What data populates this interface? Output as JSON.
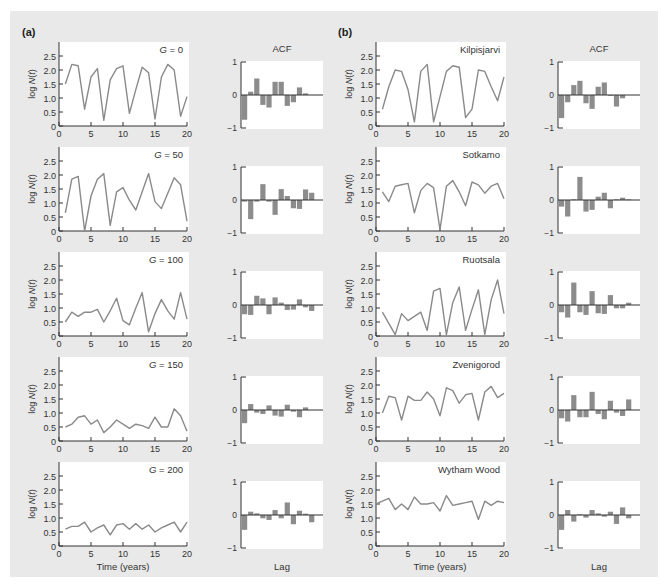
{
  "panels": [
    {
      "label": "(a)",
      "acf_title": "ACF",
      "xlabel": "Time (years)",
      "acf_xlabel": "Lag"
    },
    {
      "label": "(b)",
      "acf_title": "ACF",
      "xlabel": "Time (years)",
      "acf_xlabel": "Lag"
    }
  ],
  "axes": {
    "ylabel": "log N(t)",
    "yticks": [
      "0",
      "0.5",
      "1.0",
      "1.5",
      "2.0",
      "2.5"
    ],
    "xticks": [
      "0",
      "5",
      "10",
      "15",
      "20"
    ],
    "acf_yticks": [
      "1",
      "0",
      "−1"
    ]
  },
  "colors": {
    "background": "#e9e9e9",
    "plot_bg": "#ffffff",
    "line": "#8a8a8a",
    "bar": "#8c8c8c",
    "axis": "#333333"
  },
  "chart_data": [
    {
      "type": "line",
      "panel": "a",
      "title": "G = 0",
      "xlabel": "Time (years)",
      "ylabel": "log N(t)",
      "xlim": [
        0,
        20
      ],
      "ylim": [
        0,
        3
      ],
      "x": [
        1,
        2,
        3,
        4,
        5,
        6,
        7,
        8,
        9,
        10,
        11,
        12,
        13,
        14,
        15,
        16,
        17,
        18,
        19,
        20
      ],
      "values": [
        1.5,
        2.2,
        2.15,
        0.6,
        1.75,
        2.05,
        0.2,
        1.65,
        2.05,
        2.15,
        0.45,
        1.3,
        2.1,
        1.9,
        0.25,
        1.75,
        2.2,
        2.0,
        0.35,
        1.05
      ]
    },
    {
      "type": "bar",
      "panel": "a",
      "title": "ACF",
      "series_of": "G = 0",
      "ylim": [
        -1,
        1
      ],
      "values": [
        -0.75,
        0.1,
        0.5,
        -0.3,
        -0.38,
        0.4,
        0.4,
        -0.33,
        -0.22,
        0.23,
        0.05
      ]
    },
    {
      "type": "line",
      "panel": "a",
      "title": "G = 50",
      "xlim": [
        0,
        20
      ],
      "ylim": [
        0,
        3
      ],
      "x": [
        1,
        2,
        3,
        4,
        5,
        6,
        7,
        8,
        9,
        10,
        11,
        12,
        13,
        14,
        15,
        16,
        17,
        18,
        19,
        20
      ],
      "values": [
        0.65,
        1.85,
        1.95,
        0.0,
        1.25,
        1.85,
        2.05,
        0.2,
        1.4,
        1.55,
        1.1,
        0.75,
        1.4,
        2.05,
        1.05,
        0.8,
        1.35,
        1.9,
        1.65,
        0.35
      ]
    },
    {
      "type": "bar",
      "panel": "a",
      "title": "ACF",
      "series_of": "G = 50",
      "ylim": [
        -1,
        1
      ],
      "values": [
        -0.05,
        -0.58,
        -0.05,
        0.48,
        -0.05,
        -0.45,
        0.33,
        0.12,
        -0.25,
        -0.27,
        0.32,
        0.22
      ]
    },
    {
      "type": "line",
      "panel": "a",
      "title": "G = 100",
      "xlim": [
        0,
        20
      ],
      "ylim": [
        0,
        3
      ],
      "x": [
        1,
        2,
        3,
        4,
        5,
        6,
        7,
        8,
        9,
        10,
        11,
        12,
        13,
        14,
        15,
        16,
        17,
        18,
        19,
        20
      ],
      "values": [
        0.5,
        0.85,
        0.7,
        0.85,
        0.85,
        0.95,
        0.5,
        0.9,
        1.35,
        0.55,
        0.4,
        1.0,
        1.55,
        0.15,
        0.8,
        1.3,
        0.9,
        0.6,
        1.55,
        0.6
      ]
    },
    {
      "type": "bar",
      "panel": "a",
      "title": "ACF",
      "series_of": "G = 100",
      "ylim": [
        -1,
        1
      ],
      "values": [
        -0.28,
        -0.3,
        0.28,
        0.2,
        -0.28,
        0.23,
        0.07,
        -0.15,
        -0.14,
        0.17,
        -0.07,
        -0.18
      ]
    },
    {
      "type": "line",
      "panel": "a",
      "title": "G = 150",
      "xlim": [
        0,
        20
      ],
      "ylim": [
        0,
        3
      ],
      "x": [
        1,
        2,
        3,
        4,
        5,
        6,
        7,
        8,
        9,
        10,
        11,
        12,
        13,
        14,
        15,
        16,
        17,
        18,
        19,
        20
      ],
      "values": [
        0.5,
        0.6,
        0.85,
        0.9,
        0.6,
        0.75,
        0.3,
        0.5,
        0.75,
        0.6,
        0.45,
        0.6,
        0.55,
        0.45,
        0.85,
        0.5,
        0.5,
        1.15,
        0.9,
        0.35
      ]
    },
    {
      "type": "bar",
      "panel": "a",
      "title": "ACF",
      "series_of": "G = 150",
      "ylim": [
        -1,
        1
      ],
      "values": [
        -0.4,
        0.18,
        -0.08,
        -0.12,
        0.14,
        -0.17,
        -0.2,
        0.16,
        -0.05,
        -0.22,
        0.08
      ]
    },
    {
      "type": "line",
      "panel": "a",
      "title": "G = 200",
      "xlim": [
        0,
        20
      ],
      "ylim": [
        0,
        3
      ],
      "x": [
        1,
        2,
        3,
        4,
        5,
        6,
        7,
        8,
        9,
        10,
        11,
        12,
        13,
        14,
        15,
        16,
        17,
        18,
        19,
        20
      ],
      "values": [
        0.6,
        0.7,
        0.7,
        0.85,
        0.5,
        0.65,
        0.75,
        0.4,
        0.75,
        0.8,
        0.6,
        0.8,
        0.6,
        0.75,
        0.5,
        0.65,
        0.75,
        0.85,
        0.5,
        0.85
      ]
    },
    {
      "type": "bar",
      "panel": "a",
      "title": "ACF",
      "series_of": "G = 200",
      "ylim": [
        -1,
        1
      ],
      "values": [
        -0.45,
        0.1,
        0.05,
        -0.1,
        -0.15,
        0.15,
        -0.1,
        0.38,
        -0.28,
        0.13,
        0.04,
        -0.22
      ]
    },
    {
      "type": "line",
      "panel": "b",
      "title": "Kilpisjarvi",
      "xlim": [
        0,
        20
      ],
      "ylim": [
        0,
        3
      ],
      "x": [
        1,
        2,
        3,
        4,
        5,
        6,
        7,
        8,
        9,
        10,
        11,
        12,
        13,
        14,
        15,
        16,
        17,
        18,
        19,
        20
      ],
      "values": [
        0.6,
        1.4,
        2.0,
        1.95,
        1.3,
        0.15,
        1.95,
        2.2,
        0.15,
        1.05,
        1.95,
        2.15,
        2.1,
        0.3,
        0.6,
        2.0,
        1.95,
        1.4,
        0.9,
        1.75
      ]
    },
    {
      "type": "bar",
      "panel": "b",
      "title": "ACF",
      "series_of": "Kilpisjarvi",
      "ylim": [
        -1,
        1
      ],
      "values": [
        -0.7,
        -0.22,
        0.3,
        0.43,
        -0.25,
        -0.42,
        0.25,
        0.38,
        -0.02,
        -0.35,
        -0.1
      ]
    },
    {
      "type": "line",
      "panel": "b",
      "title": "Sotkamo",
      "xlim": [
        0,
        20
      ],
      "ylim": [
        0,
        3
      ],
      "x": [
        1,
        2,
        3,
        4,
        5,
        6,
        7,
        8,
        9,
        10,
        11,
        12,
        13,
        14,
        15,
        16,
        17,
        18,
        19,
        20
      ],
      "values": [
        1.4,
        1.05,
        1.6,
        1.65,
        1.7,
        0.65,
        1.45,
        1.7,
        1.55,
        0.05,
        1.6,
        1.8,
        1.4,
        0.9,
        1.75,
        1.65,
        1.35,
        1.6,
        1.7,
        1.15
      ]
    },
    {
      "type": "bar",
      "panel": "b",
      "title": "ACF",
      "series_of": "Sotkamo",
      "ylim": [
        -1,
        1
      ],
      "values": [
        -0.2,
        -0.5,
        0.02,
        0.7,
        -0.35,
        -0.3,
        0.1,
        0.22,
        -0.25,
        0.02,
        0.07,
        0.02
      ]
    },
    {
      "type": "line",
      "panel": "b",
      "title": "Ruotsala",
      "xlim": [
        0,
        20
      ],
      "ylim": [
        0,
        3
      ],
      "x": [
        1,
        2,
        3,
        4,
        5,
        6,
        7,
        8,
        9,
        10,
        11,
        12,
        13,
        14,
        15,
        16,
        17,
        18,
        19,
        20
      ],
      "values": [
        0.85,
        0.45,
        0.05,
        0.8,
        0.55,
        0.7,
        0.85,
        0.2,
        1.6,
        1.7,
        0.05,
        1.2,
        1.75,
        0.2,
        0.95,
        1.65,
        0.05,
        1.3,
        2.0,
        0.8
      ]
    },
    {
      "type": "bar",
      "panel": "b",
      "title": "ACF",
      "series_of": "Ruotsala",
      "ylim": [
        -1,
        1
      ],
      "values": [
        -0.22,
        -0.38,
        0.68,
        -0.22,
        -0.3,
        0.42,
        -0.25,
        -0.27,
        0.3,
        -0.1,
        -0.1,
        0.07
      ]
    },
    {
      "type": "line",
      "panel": "b",
      "title": "Zvenigorod",
      "xlim": [
        0,
        20
      ],
      "ylim": [
        0,
        3
      ],
      "x": [
        1,
        2,
        3,
        4,
        5,
        6,
        7,
        8,
        9,
        10,
        11,
        12,
        13,
        14,
        15,
        16,
        17,
        18,
        19,
        20
      ],
      "values": [
        1.0,
        1.6,
        1.55,
        0.75,
        1.6,
        1.45,
        1.45,
        1.75,
        1.5,
        0.9,
        1.9,
        1.8,
        1.35,
        1.65,
        1.7,
        0.75,
        1.75,
        1.95,
        1.55,
        1.7
      ]
    },
    {
      "type": "bar",
      "panel": "b",
      "title": "ACF",
      "series_of": "Zvenigorod",
      "ylim": [
        -1,
        1
      ],
      "values": [
        -0.25,
        -0.35,
        0.45,
        -0.22,
        -0.22,
        0.55,
        -0.12,
        -0.28,
        0.28,
        -0.08,
        -0.18,
        0.32
      ]
    },
    {
      "type": "line",
      "panel": "b",
      "title": "Wytham Wood",
      "xlim": [
        0,
        20
      ],
      "ylim": [
        0,
        3
      ],
      "x": [
        0,
        1,
        2,
        3,
        4,
        5,
        6,
        7,
        8,
        9,
        10,
        11,
        12,
        13,
        14,
        15,
        16,
        17,
        18,
        19,
        20
      ],
      "values": [
        1.5,
        1.6,
        1.7,
        1.3,
        1.5,
        1.3,
        1.75,
        1.5,
        1.5,
        1.55,
        1.25,
        1.8,
        1.45,
        1.5,
        1.55,
        1.6,
        0.95,
        1.6,
        1.45,
        1.6,
        1.55
      ]
    },
    {
      "type": "bar",
      "panel": "b",
      "title": "ACF",
      "series_of": "Wytham Wood",
      "ylim": [
        -1,
        1
      ],
      "values": [
        -0.45,
        0.15,
        -0.2,
        0.02,
        -0.08,
        0.15,
        0.05,
        -0.05,
        0.1,
        -0.27,
        0.23,
        -0.1
      ]
    }
  ]
}
